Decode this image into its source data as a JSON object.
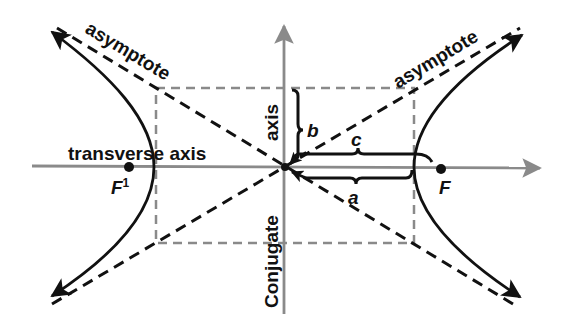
{
  "diagram": {
    "type": "hyperbola",
    "labels": {
      "asymptote_left": "asymptote",
      "asymptote_right": "asymptote",
      "transverse_axis": "transverse axis",
      "conjugate_axis_top": "axis",
      "conjugate_axis_bottom": "Conjugate",
      "b": "b",
      "c": "c",
      "a": "a",
      "focus_left": "F",
      "focus_left_sup": "1",
      "focus_right": "F"
    },
    "colors": {
      "curve": "#111111",
      "asymptote": "#111111",
      "axis": "#8a8a8a",
      "box": "#8a8a8a",
      "text": "#111111"
    },
    "elements": [
      "transverse axis (horizontal arrow)",
      "conjugate axis (vertical arrow)",
      "central rectangle (dashed)",
      "two asymptotes (dashed diagonals)",
      "two hyperbola branches with arrows",
      "foci F and F1",
      "braces for a, b, c"
    ]
  }
}
